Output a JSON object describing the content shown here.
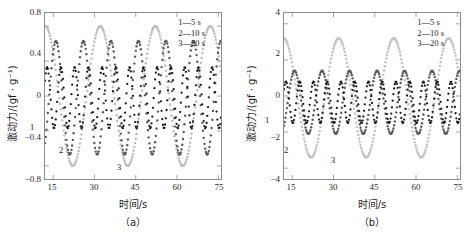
{
  "figure": {
    "panels": [
      {
        "id": "panel-a",
        "caption": "（a）",
        "xlabel": "时间/s",
        "ylabel": "激动力/(gf · g⁻¹)",
        "xticks": [
          "15",
          "30",
          "45",
          "60",
          "75"
        ],
        "yticks": [
          "0.8",
          "0.4",
          "0",
          "−0.4",
          "−0.8"
        ],
        "legend": [
          "1—5 s",
          "2—10 s",
          "3—20 s"
        ],
        "curve_tags": [
          {
            "text": "1",
            "x": 30,
            "y": 123
          },
          {
            "text": "2",
            "x": 59,
            "y": 146
          },
          {
            "text": "3",
            "x": 117,
            "y": 163
          }
        ]
      },
      {
        "id": "panel-b",
        "caption": "（b）",
        "xlabel": "时间/s",
        "ylabel": "激动力/(gf · g⁻¹)",
        "xticks": [
          "15",
          "30",
          "45",
          "60",
          "75"
        ],
        "yticks": [
          "4",
          "2",
          "0",
          "−2",
          "−4"
        ],
        "legend": [
          "1—5 s",
          "2—10 s",
          "3—20 s"
        ],
        "curve_tags": [
          {
            "text": "1",
            "x": 30,
            "y": 116
          },
          {
            "text": "2",
            "x": 49,
            "y": 146
          },
          {
            "text": "3",
            "x": 96,
            "y": 156
          }
        ]
      }
    ]
  },
  "chart_data": [
    {
      "type": "line",
      "panel": "(a)",
      "title": "",
      "xlabel": "时间/s",
      "ylabel": "激动力/(gf · g⁻¹)",
      "xlim": [
        12,
        76
      ],
      "ylim": [
        -0.95,
        0.95
      ],
      "xticks": [
        15,
        30,
        45,
        60,
        75
      ],
      "yticks": [
        0.8,
        0.4,
        0,
        -0.4,
        -0.8
      ],
      "grid": false,
      "legend_position": "top-right",
      "marker": "dotted",
      "series": [
        {
          "name": "1—5 s",
          "label": "1",
          "color": "#1a1a1a",
          "period_s": 5,
          "amplitude": 0.35,
          "offset": -0.02,
          "phase_deg": 250
        },
        {
          "name": "2—10 s",
          "label": "2",
          "color": "#5a5a5a",
          "period_s": 10,
          "amplitude": 0.65,
          "offset": -0.02,
          "phase_deg": 235
        },
        {
          "name": "3—20 s",
          "label": "3",
          "color": "#bdbdbd",
          "period_s": 20,
          "amplitude": 0.8,
          "offset": 0.0,
          "phase_deg": 232
        }
      ]
    },
    {
      "type": "line",
      "panel": "(b)",
      "title": "",
      "xlabel": "时间/s",
      "ylabel": "激动力/(gf · g⁻¹)",
      "xlim": [
        12,
        76
      ],
      "ylim": [
        -4.6,
        4.6
      ],
      "xticks": [
        15,
        30,
        45,
        60,
        75
      ],
      "yticks": [
        4,
        2,
        0,
        -2,
        -4
      ],
      "grid": false,
      "legend_position": "top-right",
      "marker": "dotted",
      "series": [
        {
          "name": "1—5 s",
          "label": "1",
          "color": "#1a1a1a",
          "period_s": 5,
          "amplitude": 1.15,
          "offset": -0.35,
          "phase_deg": 255
        },
        {
          "name": "2—10 s",
          "label": "2",
          "color": "#5a5a5a",
          "period_s": 10,
          "amplitude": 1.75,
          "offset": -0.35,
          "phase_deg": 240
        },
        {
          "name": "3—20 s",
          "label": "3",
          "color": "#c2c2c2",
          "period_s": 20,
          "amplitude": 3.3,
          "offset": -0.1,
          "phase_deg": 236
        }
      ]
    }
  ]
}
